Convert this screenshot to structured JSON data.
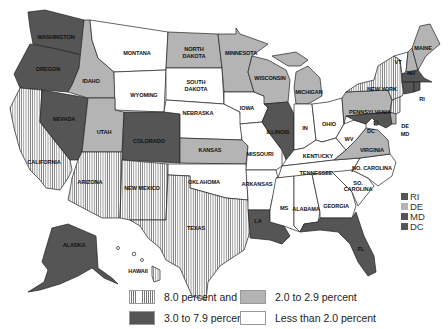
{
  "map": {
    "type": "choropleth",
    "region": "United States",
    "legend": [
      {
        "label": "8.0 percent and over",
        "class": "hatch"
      },
      {
        "label": "3.0 to 7.9 percent",
        "class": "dark"
      },
      {
        "label": "2.0 to 2.9 percent",
        "class": "mid"
      },
      {
        "label": "Less than 2.0 percent",
        "class": "light"
      }
    ],
    "small_state_legend": [
      {
        "label": "RI",
        "class": "dark"
      },
      {
        "label": "DE",
        "class": "mid"
      },
      {
        "label": "MD",
        "class": "dark"
      },
      {
        "label": "DC",
        "class": "dark"
      }
    ],
    "states": {
      "washington": {
        "label": "WASHINGTON",
        "class": "dark"
      },
      "oregon": {
        "label": "OREGON",
        "class": "dark"
      },
      "california": {
        "label": "CALIFORNIA",
        "class": "hatch"
      },
      "nevada": {
        "label": "NEVADA",
        "class": "dark"
      },
      "idaho": {
        "label": "IDAHO",
        "class": "mid"
      },
      "montana": {
        "label": "MONTANA",
        "class": "light"
      },
      "wyoming": {
        "label": "WYOMING",
        "class": "light"
      },
      "utah": {
        "label": "UTAH",
        "class": "mid"
      },
      "colorado": {
        "label": "COLORADO",
        "class": "dark"
      },
      "arizona": {
        "label": "ARIZONA",
        "class": "hatch"
      },
      "new_mexico": {
        "label": "NEW MEXICO",
        "class": "hatch"
      },
      "north_dakota": {
        "label": "NORTH DAKOTA",
        "class": "mid"
      },
      "south_dakota": {
        "label": "SOUTH DAKOTA",
        "class": "light"
      },
      "nebraska": {
        "label": "NEBRASKA",
        "class": "light"
      },
      "kansas": {
        "label": "KANSAS",
        "class": "mid"
      },
      "oklahoma": {
        "label": "OKLAHOMA",
        "class": "light"
      },
      "texas": {
        "label": "TEXAS",
        "class": "hatch"
      },
      "minnesota": {
        "label": "MINNESOTA",
        "class": "mid"
      },
      "iowa": {
        "label": "IOWA",
        "class": "light"
      },
      "missouri": {
        "label": "MISSOURI",
        "class": "light"
      },
      "arkansas": {
        "label": "ARKANSAS",
        "class": "light"
      },
      "louisiana": {
        "label": "LA",
        "class": "dark"
      },
      "wisconsin": {
        "label": "WISCONSIN",
        "class": "mid"
      },
      "illinois": {
        "label": "ILLINOIS",
        "class": "dark"
      },
      "michigan": {
        "label": "MICHIGAN",
        "class": "mid"
      },
      "indiana": {
        "label": "IN",
        "class": "light"
      },
      "ohio": {
        "label": "OHIO",
        "class": "light"
      },
      "kentucky": {
        "label": "KENTUCKY",
        "class": "light"
      },
      "tennessee": {
        "label": "TENNESSEE",
        "class": "light"
      },
      "mississippi": {
        "label": "MS",
        "class": "light"
      },
      "alabama": {
        "label": "ALABAMA",
        "class": "light"
      },
      "georgia": {
        "label": "GEORGIA",
        "class": "light"
      },
      "florida": {
        "label": "FL",
        "class": "dark"
      },
      "south_carolina": {
        "label": "SO. CAROLINA",
        "class": "light"
      },
      "north_carolina": {
        "label": "NO. CAROLINA",
        "class": "light"
      },
      "virginia": {
        "label": "VIRGINIA",
        "class": "mid"
      },
      "west_virginia": {
        "label": "WV",
        "class": "light"
      },
      "pennsylvania": {
        "label": "PENNSYLVANIA",
        "class": "mid"
      },
      "new_york": {
        "label": "NEW YORK",
        "class": "hatch"
      },
      "new_jersey": {
        "label": "NJ",
        "class": "hatch"
      },
      "delaware": {
        "label": "DE",
        "class": "mid"
      },
      "maryland": {
        "label": "MD",
        "class": "dark"
      },
      "dc": {
        "label": "DC",
        "class": "dark"
      },
      "vermont": {
        "label": "VT",
        "class": "light"
      },
      "new_hampshire": {
        "label": "NH",
        "class": "mid"
      },
      "maine": {
        "label": "MAINE",
        "class": "mid"
      },
      "massachusetts": {
        "label": "MA",
        "class": "dark"
      },
      "connecticut": {
        "label": "CT",
        "class": "dark"
      },
      "rhode_island": {
        "label": "RI",
        "class": "dark"
      },
      "alaska": {
        "label": "ALASKA",
        "class": "dark"
      },
      "hawaii": {
        "label": "HAWAII",
        "class": "hatch"
      }
    }
  }
}
